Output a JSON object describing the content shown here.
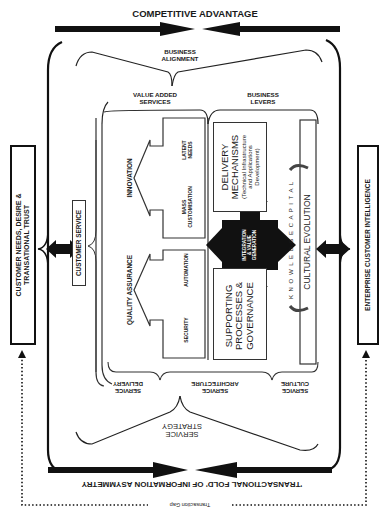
{
  "top": {
    "competitive_advantage": "COMPETITIVE ADVANTAGE",
    "business_alignment_line1": "BUSINESS",
    "business_alignment_line2": "ALIGNMENT",
    "value_added_line1": "VALUE ADDED",
    "value_added_line2": "SERVICES",
    "business_levers_line1": "BUSINESS",
    "business_levers_line2": "LEVERS"
  },
  "left": {
    "customer_needs_line1": "CUSTOMER NEEDS, DESIRE &",
    "customer_needs_line2": "TRANSATIONAL TRUST",
    "customer_service": "CUSTOMER SERVICE"
  },
  "right": {
    "enterprise_ci": "ENTERPRISE CUSTOMER INTELLIGENCE"
  },
  "value_added_services": {
    "innovation": "INNOVATION",
    "latent_needs_line1": "LATENT",
    "latent_needs_line2": "NEEDS",
    "mass_custom_line1": "MASS",
    "mass_custom_line2": "CUSTOMISATION",
    "quality_assurance": "QUALITY ASSURANCE",
    "automation": "AUTOMATION",
    "security": "SECURITY"
  },
  "business_levers": {
    "delivery_line1": "DELIVERY",
    "delivery_line2": "MECHANISMS",
    "delivery_sub1": "(Technical Infrastructure",
    "delivery_sub2": "and Applications",
    "delivery_sub3": "Development)",
    "supporting_line1": "SUPPORTING",
    "supporting_line2": "PROCESSES &",
    "supporting_line3": "GOVERNANCE",
    "integration_line1": "INTEGRATION",
    "integration_line2": "& VALUE",
    "integration_line3": "GENERATION",
    "knowledge_capital": "K N O W L E D G E   C A P I T A L",
    "cultural_evolution": "CULTURAL EVOLUTION"
  },
  "bottom": {
    "service_delivery_line1": "SERVICE",
    "service_delivery_line2": "DELIVERY",
    "service_architecture_line1": "SERVICE",
    "service_architecture_line2": "ARCHITECTURE",
    "service_culture_line1": "SERVICE",
    "service_culture_line2": "CULTURE",
    "service_strategy_line1": "SERVICE",
    "service_strategy_line2": "STRATEGY",
    "transactional_fold": "'TRANSACTIONAL FOLD' OF INFORMATION ASYMMETRY",
    "transaction_gap": "Transaction Gap"
  },
  "colors": {
    "ink": "#111111",
    "line": "#333333",
    "background": "#ffffff"
  }
}
